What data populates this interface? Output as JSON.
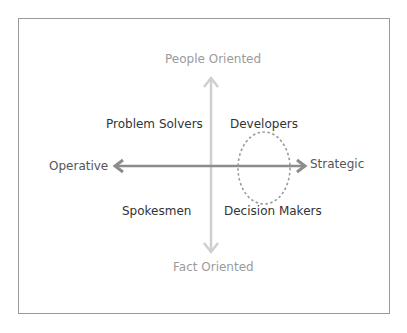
{
  "diagram": {
    "type": "quadrant",
    "axes": {
      "vertical": {
        "top_label": "People Oriented",
        "bottom_label": "Fact Oriented",
        "color": "#c8c8c8"
      },
      "horizontal": {
        "left_label": "Operative",
        "right_label": "Strategic",
        "color": "#8a8a8a"
      }
    },
    "quadrants": {
      "top_left": "Problem Solvers",
      "top_right": "Developers",
      "bottom_left": "Spokesmen",
      "bottom_right": "Decision Makers"
    },
    "highlight": {
      "shape": "dashed-ellipse",
      "color": "#9a9a9a",
      "position": "right side spanning Developers and Decision Makers on Strategic axis"
    },
    "border_color": "#9a9a9a"
  }
}
